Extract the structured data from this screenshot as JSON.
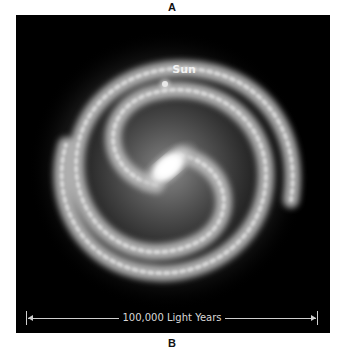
{
  "labels": {
    "top": "A",
    "bottom": "B"
  },
  "galaxy": {
    "marker_label": "Sun",
    "scale_bar_text": "100,000 Light Years",
    "colors": {
      "background": "#000000",
      "glow": "#ffffff",
      "arms": "#bdbdbd"
    }
  }
}
